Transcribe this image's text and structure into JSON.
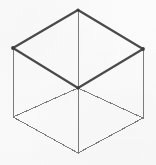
{
  "figure": {
    "shape_name": "cube",
    "projection": "isometric",
    "canvas": {
      "width": 156,
      "height": 165
    },
    "background_color": "#fbfbfb",
    "stroke_color_primary": "#4a4a4a",
    "stroke_color_secondary": "#7d7d7d",
    "stroke_width_primary": 2.1,
    "stroke_width_secondary": 1
  },
  "geometry": {
    "vertices": [
      {
        "id": "top",
        "label": "T",
        "x": 78,
        "y": 10
      },
      {
        "id": "upper-left",
        "label": "UL",
        "x": 13,
        "y": 48
      },
      {
        "id": "upper-right",
        "label": "UR",
        "x": 143,
        "y": 49
      },
      {
        "id": "center",
        "label": "C",
        "x": 78,
        "y": 88
      },
      {
        "id": "lower-left",
        "label": "LL",
        "x": 13,
        "y": 117
      },
      {
        "id": "lower-right",
        "label": "LR",
        "x": 143,
        "y": 118
      },
      {
        "id": "bottom",
        "label": "B",
        "x": 78,
        "y": 153
      }
    ],
    "edges": [
      {
        "id": "edge-top-upperleft",
        "from": "top",
        "to": "upper-left",
        "weight": "thick",
        "path": "M 78 10 L 13 48"
      },
      {
        "id": "edge-top-upperright",
        "from": "top",
        "to": "upper-right",
        "weight": "thick",
        "path": "M 78 10 L 143 49"
      },
      {
        "id": "edge-upperleft-center",
        "from": "upper-left",
        "to": "center",
        "weight": "thick",
        "path": "M 13 48 L 78 88"
      },
      {
        "id": "edge-upperright-center",
        "from": "upper-right",
        "to": "center",
        "weight": "thick",
        "path": "M 143 49 L 78 88"
      },
      {
        "id": "edge-top-center",
        "from": "top",
        "to": "center",
        "weight": "thin",
        "path": "M 78 10 L 78 88"
      },
      {
        "id": "edge-upperleft-lowerleft",
        "from": "upper-left",
        "to": "lower-left",
        "weight": "thin",
        "path": "M 13 48 L 13 117"
      },
      {
        "id": "edge-upperright-lowerright",
        "from": "upper-right",
        "to": "lower-right",
        "weight": "thin",
        "path": "M 143 49 L 143 118"
      },
      {
        "id": "edge-lowerleft-center",
        "from": "lower-left",
        "to": "center",
        "weight": "thin",
        "path": "M 13 117 L 78 88"
      },
      {
        "id": "edge-lowerright-center",
        "from": "lower-right",
        "to": "center",
        "weight": "thin",
        "path": "M 143 118 L 78 88"
      },
      {
        "id": "edge-lowerleft-bottom",
        "from": "lower-left",
        "to": "bottom",
        "weight": "thin",
        "path": "M 13 117 L 78 153"
      },
      {
        "id": "edge-lowerright-bottom",
        "from": "lower-right",
        "to": "bottom",
        "weight": "thin",
        "path": "M 143 118 L 78 153"
      },
      {
        "id": "edge-center-bottom",
        "from": "center",
        "to": "bottom",
        "weight": "thin",
        "path": "M 78 88 L 78 153"
      }
    ],
    "faces": [
      {
        "id": "face-top",
        "label": "top face",
        "path": "M 78 10 L 143 49 L 78 88 L 13 48 Z",
        "emphasis": "highlighted"
      },
      {
        "id": "face-left",
        "label": "left face",
        "path": "M 13 48 L 78 88 L 78 153 L 13 117 Z",
        "emphasis": "normal"
      },
      {
        "id": "face-right",
        "label": "right face",
        "path": "M 143 49 L 143 118 L 78 153 L 78 88 Z",
        "emphasis": "normal"
      }
    ],
    "vertex_markers": [
      {
        "id": "marker-top",
        "x": 78,
        "y": 10,
        "r": 1.6
      },
      {
        "id": "marker-upper-left",
        "x": 13,
        "y": 48,
        "r": 1.9
      },
      {
        "id": "marker-upper-right",
        "x": 143,
        "y": 49,
        "r": 1.9
      },
      {
        "id": "marker-center",
        "x": 78,
        "y": 88,
        "r": 1.7
      }
    ],
    "outline_path": "M 78 10 L 143 49 L 143 118 L 78 153 L 13 117 L 13 48 Z"
  }
}
